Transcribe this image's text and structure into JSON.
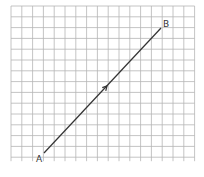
{
  "diagram": {
    "grid": {
      "x0": 11,
      "y0": 6,
      "cols": 17,
      "rows": 14,
      "cell": 10.8,
      "color": "#b5b5b5"
    },
    "points": [
      {
        "label": "A",
        "x": 44,
        "y": 153,
        "lx": 36,
        "ly": 162
      },
      {
        "label": "B",
        "x": 161,
        "y": 28,
        "lx": 163,
        "ly": 27
      }
    ],
    "line_color": "#333333",
    "arrow": {
      "x": 107,
      "y": 86,
      "direction": "A-to-B"
    }
  }
}
